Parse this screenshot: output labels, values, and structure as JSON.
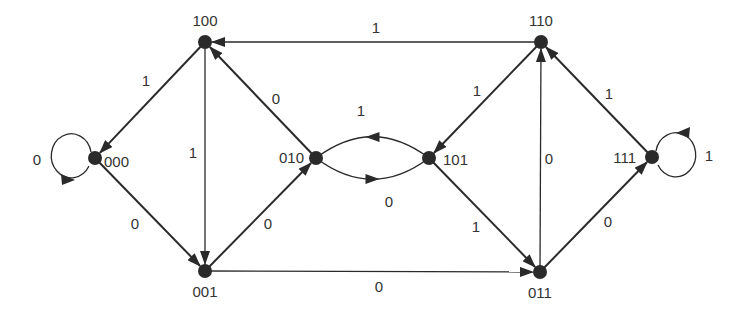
{
  "diagram": {
    "type": "state-transition-graph",
    "colors": {
      "node": "#2a2a2a",
      "edge": "#2a2a2a",
      "label": "#333333",
      "background": "#ffffff"
    },
    "nodes": [
      {
        "id": "100",
        "label": "100",
        "x": 205,
        "y": 42,
        "lx": 205,
        "ly": 26,
        "anchor": "middle"
      },
      {
        "id": "110",
        "label": "110",
        "x": 541,
        "y": 42,
        "lx": 541,
        "ly": 26,
        "anchor": "middle"
      },
      {
        "id": "000",
        "label": "000",
        "x": 95,
        "y": 158,
        "lx": 104,
        "ly": 167,
        "anchor": "start"
      },
      {
        "id": "010",
        "label": "010",
        "x": 316,
        "y": 158,
        "lx": 304,
        "ly": 163,
        "anchor": "end"
      },
      {
        "id": "101",
        "label": "101",
        "x": 429,
        "y": 158,
        "lx": 443,
        "ly": 165,
        "anchor": "start"
      },
      {
        "id": "111",
        "label": "111",
        "x": 652,
        "y": 157,
        "lx": 636,
        "ly": 163,
        "anchor": "end"
      },
      {
        "id": "001",
        "label": "001",
        "x": 205,
        "y": 271,
        "lx": 205,
        "ly": 297,
        "anchor": "middle"
      },
      {
        "id": "011",
        "label": "011",
        "x": 540,
        "y": 272,
        "lx": 540,
        "ly": 298,
        "anchor": "middle"
      }
    ],
    "edges": [
      {
        "from": "110",
        "to": "100",
        "label": "1",
        "lx": 376,
        "ly": 33
      },
      {
        "from": "100",
        "to": "000",
        "label": "1",
        "lx": 146,
        "ly": 86
      },
      {
        "from": "100",
        "to": "001",
        "label": "1",
        "lx": 193,
        "ly": 158
      },
      {
        "from": "000",
        "to": "001",
        "label": "0",
        "lx": 135,
        "ly": 229
      },
      {
        "from": "001",
        "to": "010",
        "label": "0",
        "lx": 268,
        "ly": 229
      },
      {
        "from": "010",
        "to": "100",
        "label": "0",
        "lx": 276,
        "ly": 104
      },
      {
        "from": "101",
        "to": "010",
        "label": "1",
        "lx": 361,
        "ly": 116,
        "curve": "upper"
      },
      {
        "from": "010",
        "to": "101",
        "label": "0",
        "lx": 389,
        "ly": 207,
        "curve": "lower"
      },
      {
        "from": "110",
        "to": "101",
        "label": "1",
        "lx": 477,
        "ly": 96
      },
      {
        "from": "101",
        "to": "011",
        "label": "1",
        "lx": 476,
        "ly": 232
      },
      {
        "from": "001",
        "to": "011",
        "label": "0",
        "lx": 379,
        "ly": 292
      },
      {
        "from": "011",
        "to": "110",
        "label": "0",
        "lx": 549,
        "ly": 164
      },
      {
        "from": "011",
        "to": "111",
        "label": "0",
        "lx": 608,
        "ly": 227
      },
      {
        "from": "111",
        "to": "110",
        "label": "1",
        "lx": 609,
        "ly": 99
      },
      {
        "from": "000",
        "to": "000",
        "label": "0",
        "lx": 37,
        "ly": 165,
        "loop": "left"
      },
      {
        "from": "111",
        "to": "111",
        "label": "1",
        "lx": 709,
        "ly": 161,
        "loop": "right"
      }
    ]
  }
}
